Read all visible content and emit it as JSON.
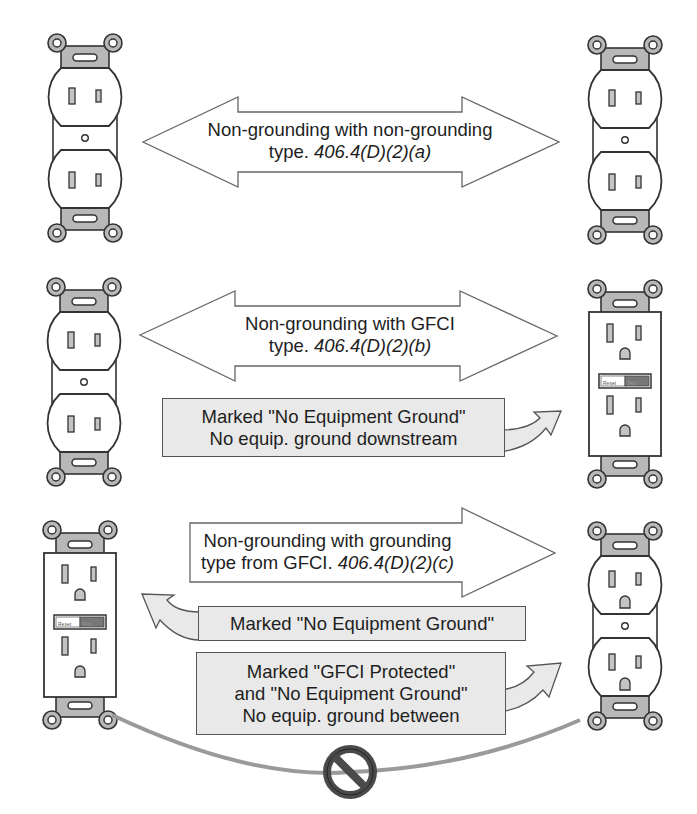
{
  "diagram": {
    "rows": [
      {
        "id": "a",
        "arrow_type": "double",
        "line1": "Non-grounding with non-grounding",
        "line2_prefix": "type. ",
        "line2_ref": "406.4(D)(2)(a)",
        "left_device": "non-grounding duplex receptacle",
        "right_device": "non-grounding duplex receptacle"
      },
      {
        "id": "b",
        "arrow_type": "double",
        "line1": "Non-grounding with GFCI",
        "line2_prefix": "type. ",
        "line2_ref": "406.4(D)(2)(b)",
        "left_device": "non-grounding duplex receptacle",
        "right_device": "GFCI receptacle",
        "notes": [
          {
            "line1": "Marked \"No Equipment Ground\"",
            "line2": "No equip. ground downstream",
            "points_to": "right"
          }
        ]
      },
      {
        "id": "c",
        "arrow_type": "right",
        "line1": "Non-grounding with grounding",
        "line2_prefix": "type from GFCI. ",
        "line2_ref": "406.4(D)(2)(c)",
        "left_device": "GFCI receptacle",
        "right_device": "grounding-type duplex receptacle",
        "notes": [
          {
            "line1": "Marked \"No Equipment Ground\"",
            "points_to": "left"
          },
          {
            "line1": "Marked \"GFCI Protected\"",
            "line2": "and \"No Equipment Ground\"",
            "line3": "No equip. ground between",
            "points_to": "right"
          }
        ],
        "prohibited_symbol": "no-ground-connection-icon"
      }
    ],
    "gfci_buttons": {
      "reset": "Reset",
      "test": "Test"
    },
    "colors": {
      "outline": "#333333",
      "strap": "#b8b8b8",
      "slot": "#c4c4c4",
      "note_fill": "#e9e9e9",
      "wire": "#9a9a9a",
      "prohibit": "#555555"
    }
  }
}
